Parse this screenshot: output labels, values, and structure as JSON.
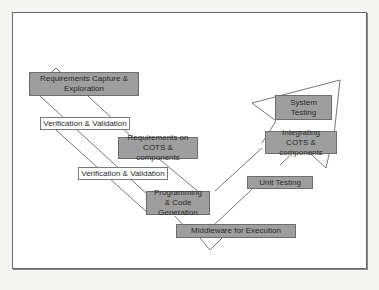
{
  "diagram": {
    "type": "V-model lifecycle",
    "colors": {
      "box_fill": "#9e9e9e",
      "box_border": "#6e6e6e",
      "label_fill": "#ffffff",
      "line": "#555555",
      "frame_border": "#6a6a6a"
    },
    "boxes": {
      "req_capture": "Requirements Capture & Exploration",
      "req_cots": "Requirements on COTS & components",
      "programming": "Programming & Code Generation",
      "middleware": "Middleware for Execution",
      "unit_testing": "Unit Testing",
      "integrating": "Integrating COTS & components",
      "system_testing": "System Testing"
    },
    "labels": {
      "vv_upper": "Verification & Validation",
      "vv_lower": "Verification & Validation"
    }
  }
}
